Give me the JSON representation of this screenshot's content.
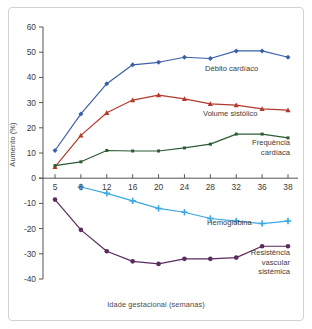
{
  "chart_data": {
    "type": "line",
    "title": "",
    "xlabel": "Idade gestacional (semanas)",
    "ylabel": "Aumento (%)",
    "x": [
      5,
      8,
      12,
      16,
      20,
      24,
      28,
      32,
      36,
      38
    ],
    "xtick_labels": [
      "5",
      "8",
      "12",
      "16",
      "20",
      "24",
      "28",
      "32",
      "36",
      "38"
    ],
    "ytick_labels": [
      "60",
      "50",
      "40",
      "30",
      "20",
      "10",
      "0",
      "-10",
      "-20",
      "-30",
      "-40"
    ],
    "yticks": [
      60,
      50,
      40,
      30,
      20,
      10,
      0,
      -10,
      -20,
      -30,
      -40
    ],
    "ylim": [
      -40,
      60
    ],
    "xlim": [
      5,
      38
    ],
    "grid": false,
    "legend_position": "inline-annotations",
    "series": [
      {
        "name": "Débito cardíaco",
        "color": "#3b5fa8",
        "marker": "diamond",
        "x": [
          5,
          8,
          12,
          16,
          20,
          24,
          28,
          32,
          36,
          38
        ],
        "values": [
          11,
          25.5,
          37.5,
          45,
          46,
          48,
          47.5,
          50.5,
          50.5,
          48
        ]
      },
      {
        "name": "Volume sistólico",
        "color": "#b33a2c",
        "marker": "triangle",
        "x": [
          5,
          8,
          12,
          16,
          20,
          24,
          28,
          32,
          36,
          38
        ],
        "values": [
          4.5,
          17,
          26,
          31,
          33,
          31.5,
          29.5,
          29,
          27.5,
          27
        ]
      },
      {
        "name": "Frequência\ncardíaca",
        "color": "#2c5b34",
        "marker": "square",
        "x": [
          5,
          8,
          12,
          16,
          20,
          24,
          28,
          32,
          36,
          38
        ],
        "values": [
          5,
          6.5,
          11,
          10.8,
          10.8,
          12,
          13.5,
          17.5,
          17.5,
          16
        ]
      },
      {
        "name": "Hemoglobina",
        "color": "#3aa8e0",
        "marker": "plus",
        "x": [
          8,
          12,
          16,
          20,
          24,
          28,
          32,
          36,
          38
        ],
        "values": [
          -3.5,
          -6,
          -9,
          -12,
          -13.5,
          -16,
          -17,
          -18,
          -17
        ]
      },
      {
        "name": "Resistência\nvascular\nsistémica",
        "color": "#5c2a5c",
        "marker": "circle",
        "x": [
          5,
          8,
          12,
          16,
          20,
          24,
          28,
          32,
          36,
          38
        ],
        "values": [
          -8.5,
          -20.5,
          -29,
          -33,
          -34,
          -32,
          -32,
          -31.5,
          -27,
          -27
        ]
      }
    ]
  },
  "labels": {
    "debito": "Débito cardíaco",
    "volume": "Volume sistólico",
    "frequencia": "Frequência\ncardíaca",
    "hemoglobina": "Hemoglobina",
    "resistencia": "Resistência\nvascular\nsistémica"
  },
  "axes": {
    "x_title": "Idade gestacional (semanas)",
    "y_title": "Aumento (%)"
  },
  "colors": {
    "debito": "#3b5fa8",
    "volume": "#b33a2c",
    "frequencia": "#2c5b34",
    "hemoglobina": "#3aa8e0",
    "resistencia": "#5c2a5c",
    "axis": "#555555",
    "frame": "#d2d2d2",
    "background": "#ffffff"
  }
}
